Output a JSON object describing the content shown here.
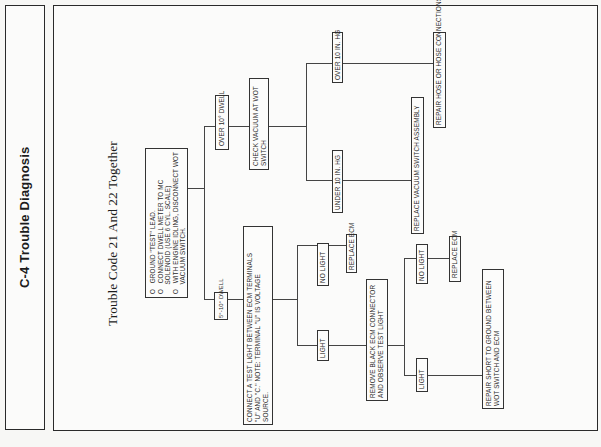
{
  "page": {
    "side_title": "C-4 Trouble Diagnosis",
    "subtitle": "Trouble Code 21 And 22 Together"
  },
  "flowchart": {
    "start": {
      "steps": [
        "GROUND \"TEST\" LEAD.",
        "CONNECT DWELL METER TO MC SOLENOID (USE 6 CYL. SCALE).",
        "WITH ENGINE IDLING, DISCONNECT WOT VACUUM SWITCH."
      ],
      "lines": [
        "GROUND \"TEST\" LEAD.",
        "CONNECT DWELL METER TO MC",
        "SOLENOID (USE 6 CYL. SCALE)",
        "WITH ENGINE IDLING, DISCONNECT WOT",
        "VACUUM SWITCH."
      ]
    },
    "branch_over_dwell": {
      "label": "OVER 10° DWELL",
      "action": {
        "lines": [
          "CHECK VACUUM AT WOT",
          "SWITCH"
        ]
      },
      "over_hg": {
        "label": "OVER 10 IN. HG",
        "result": "REPAIR HOSE OR HOSE CONNECTIONS"
      },
      "under_hg": {
        "label": "UNDER 10 IN. HG",
        "result": "REPLACE VACUUM SWITCH ASSEMBLY"
      }
    },
    "branch_5_10_dwell": {
      "label": "5°-10° DWELL",
      "action": {
        "lines": [
          "CONNECT A TEST LIGHT BETWEEN ECM TERMINALS",
          "\"U\" AND \"C.\" NOTE: TERMINAL \"U\" IS VOLTAGE",
          "SOURCE."
        ]
      },
      "no_light": {
        "label": "NO LIGHT",
        "result": "REPLACE ECM"
      },
      "light": {
        "label": "LIGHT",
        "action": {
          "lines": [
            "REMOVE BLACK ECM CONNECTOR",
            "AND OBSERVE TEST LIGHT"
          ]
        },
        "no_light": {
          "label": "NO LIGHT",
          "result": "REPLACE ECM"
        },
        "light": {
          "label": "LIGHT",
          "result_lines": [
            "REPAIR SHORT TO GROUND BETWEEN",
            "WOT SWITCH AND ECM"
          ]
        }
      }
    }
  },
  "colors": {
    "background": "#f7f7f5",
    "ink": "#2a2a2a"
  }
}
